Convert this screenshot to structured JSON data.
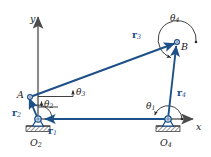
{
  "figure": {
    "name": "four-bar-linkage-vector-loop-diagram",
    "background_color": "#ffffff",
    "vector_color": "#1d4f88",
    "axis_color": "#7d7d7d",
    "text_color": "#1a1a1a",
    "ground_hatch_color": "#4a4a4a"
  },
  "axes": {
    "y_label": "y",
    "x_label": "x"
  },
  "points": {
    "A": "A",
    "B": "B",
    "O2": {
      "base": "O",
      "sub": "2"
    },
    "O4": {
      "base": "O",
      "sub": "4"
    }
  },
  "vectors": [
    {
      "name": "r1",
      "base": "r",
      "sub": "1"
    },
    {
      "name": "r2",
      "base": "r",
      "sub": "2"
    },
    {
      "name": "r3",
      "base": "r",
      "sub": "3"
    },
    {
      "name": "r4",
      "base": "r",
      "sub": "4"
    }
  ],
  "angles": [
    {
      "name": "theta1",
      "base": "θ",
      "sub": "1"
    },
    {
      "name": "theta2",
      "base": "θ",
      "sub": "2"
    },
    {
      "name": "theta3",
      "base": "θ",
      "sub": "3"
    },
    {
      "name": "theta4",
      "base": "θ",
      "sub": "4"
    }
  ],
  "geometry": {
    "O2": [
      38,
      119
    ],
    "O4": [
      168,
      119
    ],
    "A": [
      30,
      97
    ],
    "B": [
      177,
      42
    ],
    "y_axis_top": [
      38,
      14
    ],
    "x_axis_right": [
      197,
      119
    ]
  }
}
